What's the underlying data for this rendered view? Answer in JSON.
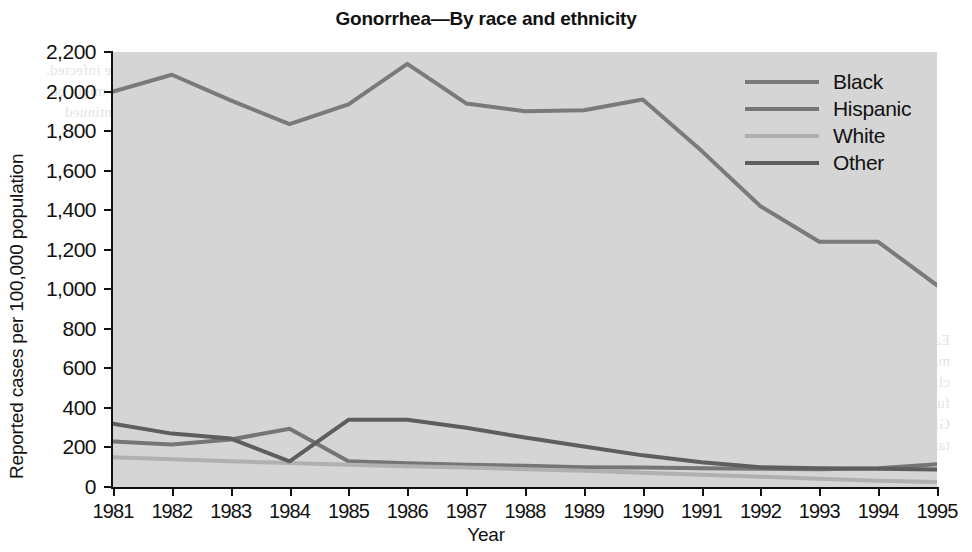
{
  "chart_data": {
    "type": "line",
    "title": "Gonorrhea—By race and ethnicity",
    "xlabel": "Year",
    "ylabel": "Reported cases per 100,000 population",
    "categories": [
      1981,
      1982,
      1983,
      1984,
      1985,
      1986,
      1987,
      1988,
      1989,
      1990,
      1991,
      1992,
      1993,
      1994,
      1995
    ],
    "x": [
      "1981",
      "1982",
      "1983",
      "1984",
      "1985",
      "1986",
      "1987",
      "1988",
      "1989",
      "1990",
      "1991",
      "1992",
      "1993",
      "1994",
      "1995"
    ],
    "xlim": [
      1981,
      1995
    ],
    "ylim": [
      0,
      2200
    ],
    "yticks": [
      0,
      200,
      400,
      600,
      800,
      1000,
      1200,
      1400,
      1600,
      1800,
      2000,
      2200
    ],
    "ytick_labels": [
      "0",
      "200",
      "400",
      "600",
      "800",
      "1,000",
      "1,200",
      "1,400",
      "1,600",
      "1,800",
      "2,000",
      "2,200"
    ],
    "grid": false,
    "legend_position": "top-right",
    "series": [
      {
        "name": "Black",
        "color": "#7a7a7a",
        "values": [
          2000,
          2085,
          1955,
          1835,
          1935,
          2140,
          1940,
          1900,
          1905,
          1960,
          1700,
          1420,
          1240,
          1240,
          1020
        ]
      },
      {
        "name": "Hispanic",
        "color": "#757575",
        "values": [
          230,
          215,
          240,
          295,
          130,
          120,
          112,
          108,
          100,
          98,
          95,
          92,
          90,
          95,
          115
        ]
      },
      {
        "name": "White",
        "color": "#b0b0b0",
        "values": [
          150,
          140,
          130,
          122,
          112,
          105,
          98,
          90,
          82,
          72,
          62,
          52,
          42,
          32,
          25
        ]
      },
      {
        "name": "Other",
        "color": "#5e5e5e",
        "values": [
          320,
          270,
          245,
          130,
          340,
          340,
          300,
          250,
          205,
          160,
          125,
          100,
          95,
          92,
          88
        ]
      }
    ]
  },
  "legend": {
    "items": [
      {
        "label": "Black"
      },
      {
        "label": "Hispanic"
      },
      {
        "label": "White"
      },
      {
        "label": "Other"
      }
    ]
  },
  "background_bleed": {
    "col1": "of the people in the household are infected. The total number of persons who might be affected and the possibility of continued transmission are important.",
    "col2": "The individual decides whether he or she wishes to participate in any prevention or control measures. The decision to accept or reject a proposed prevention activity may be based on a risk assessment of the disease, as well as the perceived value of the offered intervention.",
    "col3": "Early treatment of infected persons is the mainstay of prevention. Intervention with clinical partner management may prevent further transmission within a sexual network. Given limited resources, it is important to target interventions."
  }
}
